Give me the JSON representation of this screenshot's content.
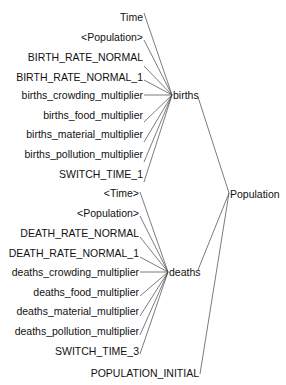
{
  "diagram": {
    "root": {
      "id": "Population",
      "label": "Population",
      "x": 229,
      "y": 192
    },
    "intermediate": [
      {
        "id": "births",
        "label": "births",
        "x": 173,
        "y": 95
      },
      {
        "id": "deaths",
        "label": "deaths",
        "x": 171,
        "y": 272
      }
    ],
    "root_inputs": [
      "births",
      "deaths",
      "POPULATION_INITIAL"
    ],
    "leaves": [
      {
        "id": "time",
        "label": "Time",
        "x": 142,
        "y": 18,
        "target": "births"
      },
      {
        "id": "population_shadow_1",
        "label": "<Population>",
        "x": 142,
        "y": 43,
        "target": "births"
      },
      {
        "id": "birth_rate_normal",
        "label": "BIRTH_RATE_NORMAL",
        "x": 142,
        "y": 69,
        "target": "births"
      },
      {
        "id": "birth_rate_normal_1",
        "label": "BIRTH_RATE_NORMAL_1",
        "x": 142,
        "y": 95,
        "target": "births"
      },
      {
        "id": "births_crowding_multiplier",
        "label": "births_crowding_multiplier",
        "x": 142,
        "y": 121,
        "target": "births"
      },
      {
        "id": "births_food_multiplier",
        "label": "births_food_multiplier",
        "x": 142,
        "y": 147,
        "target": "births"
      },
      {
        "id": "births_material_multiplier",
        "label": "births_material_multiplier",
        "x": 142,
        "y": 173,
        "target": "births"
      },
      {
        "id": "births_pollution_multiplier",
        "label": "births_pollution_multiplier",
        "x": 142,
        "y": 199,
        "target": "births"
      },
      {
        "id": "switch_time_1",
        "label": "SWITCH_TIME_1",
        "x": 142,
        "y": 225,
        "target": "births"
      },
      {
        "id": "time_shadow",
        "label": "<Time>",
        "x": 138,
        "y": 195,
        "target": "deaths"
      },
      {
        "id": "population_shadow_2",
        "label": "<Population>",
        "x": 138,
        "y": 221,
        "target": "deaths"
      },
      {
        "id": "death_rate_normal",
        "label": "DEATH_RATE_NORMAL",
        "x": 138,
        "y": 246,
        "target": "deaths"
      },
      {
        "id": "death_rate_normal_1",
        "label": "DEATH_RATE_NORMAL_1",
        "x": 138,
        "y": 272,
        "target": "deaths"
      },
      {
        "id": "deaths_crowding_multiplier",
        "label": "deaths_crowding_multiplier",
        "x": 138,
        "y": 298,
        "target": "deaths"
      },
      {
        "id": "deaths_food_multiplier",
        "label": "deaths_food_multiplier",
        "x": 138,
        "y": 324,
        "target": "deaths"
      },
      {
        "id": "deaths_material_multiplier",
        "label": "deaths_material_multiplier",
        "x": 138,
        "y": 350,
        "target": "deaths"
      },
      {
        "id": "deaths_pollution_multiplier",
        "label": "deaths_pollution_multiplier",
        "x": 138,
        "y": 376,
        "target": "deaths"
      },
      {
        "id": "switch_time_3",
        "label": "SWITCH_TIME_3",
        "x": 138,
        "y": 402,
        "target": "deaths"
      },
      {
        "id": "population_initial",
        "label": "POPULATION_INITIAL",
        "x": 199,
        "y": 376,
        "target": "Population"
      }
    ]
  },
  "labels": {
    "time": "Time",
    "population_shadow_1": "<Population>",
    "birth_rate_normal": "BIRTH_RATE_NORMAL",
    "birth_rate_normal_1": "BIRTH_RATE_NORMAL_1",
    "births_crowding_multiplier": "births_crowding_multiplier",
    "births_food_multiplier": "births_food_multiplier",
    "births_material_multiplier": "births_material_multiplier",
    "births_pollution_multiplier": "births_pollution_multiplier",
    "switch_time_1": "SWITCH_TIME_1",
    "births": "births",
    "population": "Population",
    "time_shadow": "<Time>",
    "population_shadow_2": "<Population>",
    "death_rate_normal": "DEATH_RATE_NORMAL",
    "death_rate_normal_1": "DEATH_RATE_NORMAL_1",
    "deaths_crowding_multiplier": "deaths_crowding_multiplier",
    "deaths_food_multiplier": "deaths_food_multiplier",
    "deaths_material_multiplier": "deaths_material_multiplier",
    "deaths_pollution_multiplier": "deaths_pollution_multiplier",
    "switch_time_3": "SWITCH_TIME_3",
    "deaths": "deaths",
    "population_initial": "POPULATION_INITIAL"
  },
  "colors": {
    "text": "#111111",
    "edge": "#444444",
    "background": "#ffffff"
  }
}
